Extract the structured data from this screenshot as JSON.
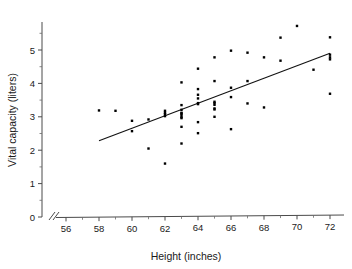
{
  "chart_data": {
    "type": "scatter",
    "title": "",
    "xlabel": "Height (inches)",
    "ylabel": "Vital capacity (liters)",
    "xlim": [
      55.2,
      73.2
    ],
    "ylim": [
      0,
      5.75
    ],
    "xticks": [
      56,
      58,
      60,
      62,
      64,
      66,
      68,
      70,
      72
    ],
    "xtick_labels": [
      "56",
      "58",
      "60",
      "62",
      "64",
      "66",
      "68",
      "70",
      "72"
    ],
    "xminor_ticks": [
      57,
      59,
      61,
      63,
      65,
      67,
      69,
      71
    ],
    "yticks": [
      0,
      1,
      2,
      3,
      4,
      5
    ],
    "ytick_labels": [
      "0",
      "1",
      "2",
      "3",
      "4",
      "5"
    ],
    "yminor_ticks": [
      0.5,
      1.5,
      2.5,
      3.5,
      4.5,
      5.5
    ],
    "grid": false,
    "legend": null,
    "axis_break": {
      "axis": "x",
      "between": [
        55.2,
        55.8
      ],
      "style": "double-slash"
    },
    "x": [
      58.0,
      59.0,
      60.0,
      60.0,
      61.0,
      61.0,
      62.0,
      62.0,
      62.0,
      62.0,
      62.0,
      63.0,
      63.0,
      63.0,
      63.0,
      63.0,
      63.0,
      63.0,
      63.0,
      63.0,
      63.0,
      64.0,
      64.0,
      64.0,
      64.0,
      64.0,
      64.0,
      64.0,
      64.0,
      65.0,
      65.0,
      65.0,
      65.0,
      65.0,
      65.0,
      65.0,
      65.0,
      66.0,
      66.0,
      66.0,
      66.0,
      67.0,
      67.0,
      67.0,
      68.0,
      68.0,
      69.0,
      69.0,
      70.0,
      71.0,
      72.0,
      72.0,
      72.0,
      72.0,
      72.0
    ],
    "y": [
      3.19,
      3.18,
      2.88,
      2.57,
      2.92,
      2.05,
      3.18,
      3.12,
      3.02,
      1.6,
      3.08,
      4.03,
      3.35,
      3.21,
      3.12,
      3.05,
      2.99,
      2.96,
      2.7,
      2.2,
      3.1,
      4.44,
      3.83,
      3.66,
      3.55,
      3.41,
      2.84,
      2.51,
      3.38,
      4.78,
      4.07,
      3.45,
      3.41,
      3.36,
      3.25,
      3.22,
      3.0,
      4.98,
      3.87,
      3.59,
      2.63,
      4.92,
      4.07,
      3.4,
      4.78,
      3.28,
      5.37,
      4.68,
      5.72,
      4.41,
      5.38,
      4.86,
      4.78,
      4.72,
      3.69
    ],
    "series_name": "observations",
    "fit_line": {
      "type": "linear-regression",
      "x_start": 58.0,
      "y_start": 2.28,
      "x_end": 72.0,
      "y_end": 4.9
    },
    "n_points": 55,
    "marker": "square",
    "marker_size": 2.4,
    "point_color": "#000000",
    "line_color": "#111111",
    "axis_color": "#4a4a4a",
    "background": "#ffffff"
  }
}
